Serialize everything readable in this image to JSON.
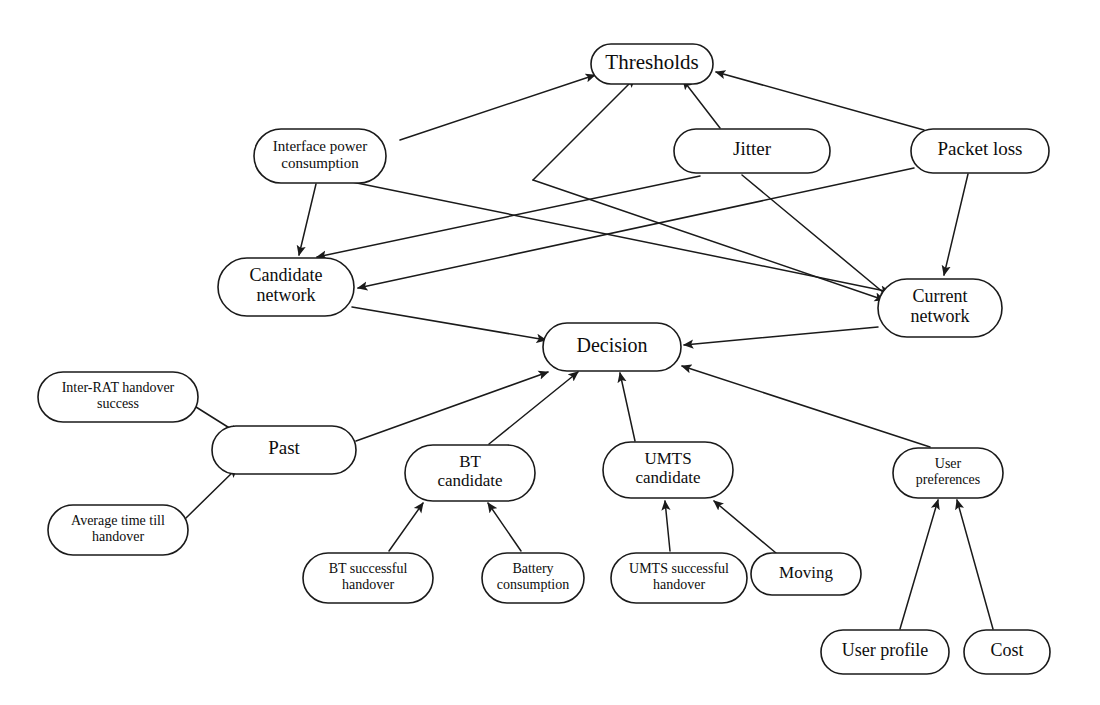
{
  "diagram": {
    "type": "directed-graph",
    "background_color": "#ffffff",
    "node_fill": "#ffffff",
    "node_stroke": "#1a1a1a",
    "edge_color": "#1a1a1a",
    "nodes": [
      {
        "id": "thresholds",
        "label": "Thresholds",
        "lines": [
          "Thresholds"
        ],
        "x": 652,
        "y": 64,
        "w": 122,
        "h": 40,
        "font_size": 21
      },
      {
        "id": "interface_power",
        "label": "Interface power consumption",
        "lines": [
          "Interface power",
          "consumption"
        ],
        "x": 320,
        "y": 156,
        "w": 132,
        "h": 54,
        "font_size": 15
      },
      {
        "id": "jitter",
        "label": "Jitter",
        "lines": [
          "Jitter"
        ],
        "x": 752,
        "y": 151,
        "w": 156,
        "h": 44,
        "font_size": 19
      },
      {
        "id": "packet_loss",
        "label": "Packet loss",
        "lines": [
          "Packet loss"
        ],
        "x": 980,
        "y": 151,
        "w": 138,
        "h": 44,
        "font_size": 19
      },
      {
        "id": "candidate_net",
        "label": "Candidate network",
        "lines": [
          "Candidate",
          "network"
        ],
        "x": 286,
        "y": 287,
        "w": 136,
        "h": 58,
        "font_size": 18
      },
      {
        "id": "current_net",
        "label": "Current network",
        "lines": [
          "Current",
          "network"
        ],
        "x": 940,
        "y": 308,
        "w": 124,
        "h": 58,
        "font_size": 18
      },
      {
        "id": "decision",
        "label": "Decision",
        "lines": [
          "Decision"
        ],
        "x": 612,
        "y": 347,
        "w": 138,
        "h": 48,
        "font_size": 20
      },
      {
        "id": "inter_rat",
        "label": "Inter-RAT handover success",
        "lines": [
          "Inter-RAT handover",
          "success"
        ],
        "x": 118,
        "y": 397,
        "w": 160,
        "h": 50,
        "font_size": 14
      },
      {
        "id": "past",
        "label": "Past",
        "lines": [
          "Past"
        ],
        "x": 284,
        "y": 450,
        "w": 144,
        "h": 48,
        "font_size": 19
      },
      {
        "id": "avg_time",
        "label": "Average time till handover",
        "lines": [
          "Average time till",
          "handover"
        ],
        "x": 118,
        "y": 530,
        "w": 140,
        "h": 50,
        "font_size": 14
      },
      {
        "id": "bt_candidate",
        "label": "BT candidate",
        "lines": [
          "BT",
          "candidate"
        ],
        "x": 470,
        "y": 473,
        "w": 130,
        "h": 56,
        "font_size": 17
      },
      {
        "id": "umts_candidate",
        "label": "UMTS candidate",
        "lines": [
          "UMTS",
          "candidate"
        ],
        "x": 668,
        "y": 470,
        "w": 130,
        "h": 56,
        "font_size": 17
      },
      {
        "id": "user_prefs",
        "label": "User preferences",
        "lines": [
          "User",
          "preferences"
        ],
        "x": 948,
        "y": 473,
        "w": 110,
        "h": 50,
        "font_size": 14
      },
      {
        "id": "bt_success",
        "label": "BT successful handover",
        "lines": [
          "BT successful",
          "handover"
        ],
        "x": 368,
        "y": 578,
        "w": 130,
        "h": 50,
        "font_size": 14
      },
      {
        "id": "battery",
        "label": "Battery consumption",
        "lines": [
          "Battery",
          "consumption"
        ],
        "x": 533,
        "y": 578,
        "w": 102,
        "h": 50,
        "font_size": 14
      },
      {
        "id": "umts_success",
        "label": "UMTS successful handover",
        "lines": [
          "UMTS successful",
          "handover"
        ],
        "x": 679,
        "y": 578,
        "w": 136,
        "h": 50,
        "font_size": 14
      },
      {
        "id": "moving",
        "label": "Moving",
        "lines": [
          "Moving"
        ],
        "x": 806,
        "y": 574,
        "w": 110,
        "h": 42,
        "font_size": 17
      },
      {
        "id": "user_profile",
        "label": "User profile",
        "lines": [
          "User profile"
        ],
        "x": 885,
        "y": 652,
        "w": 128,
        "h": 44,
        "font_size": 18
      },
      {
        "id": "cost",
        "label": "Cost",
        "lines": [
          "Cost"
        ],
        "x": 1007,
        "y": 652,
        "w": 86,
        "h": 44,
        "font_size": 18
      }
    ],
    "edges": [
      {
        "id": "e1",
        "from": "interface_power",
        "to": "thresholds",
        "points": "400,140 595,75",
        "arrow": true
      },
      {
        "id": "e2",
        "from": "candidate_net",
        "to": "thresholds",
        "points": "533,180 635,78",
        "arrow": true
      },
      {
        "id": "e3",
        "from": "jitter",
        "to": "thresholds",
        "points": "720,128 683,80",
        "arrow": true
      },
      {
        "id": "e4",
        "from": "packet_loss",
        "to": "thresholds",
        "points": "924,130 716,72",
        "arrow": true
      },
      {
        "id": "e5",
        "from": "interface_power",
        "to": "candidate_net",
        "points": "316,184 299,255",
        "arrow": true
      },
      {
        "id": "e6",
        "from": "jitter",
        "to": "candidate_net",
        "points": "700,176 317,257",
        "arrow": true
      },
      {
        "id": "e7",
        "from": "packet_loss",
        "to": "candidate_net",
        "points": "914,168 358,288",
        "arrow": true
      },
      {
        "id": "e8",
        "from": "packet_loss",
        "to": "current_net",
        "points": "968,174 944,275",
        "arrow": true
      },
      {
        "id": "e9",
        "from": "interface_power",
        "to": "current_net",
        "points": "352,182 890,292",
        "arrow": true
      },
      {
        "id": "e10",
        "from": "thresholds",
        "to": "current_net",
        "points": "533,180 884,300",
        "arrow": true
      },
      {
        "id": "e11",
        "from": "jitter",
        "to": "current_net",
        "points": "742,175 890,298",
        "arrow": true
      },
      {
        "id": "e12",
        "from": "candidate_net",
        "to": "decision",
        "points": "352,307 546,340",
        "arrow": true
      },
      {
        "id": "e13",
        "from": "current_net",
        "to": "decision",
        "points": "878,327 684,345",
        "arrow": true
      },
      {
        "id": "e14",
        "from": "past",
        "to": "decision",
        "points": "356,441 548,372",
        "arrow": true
      },
      {
        "id": "e15",
        "from": "bt_candidate",
        "to": "decision",
        "points": "489,444 578,372",
        "arrow": true
      },
      {
        "id": "e16",
        "from": "umts_candidate",
        "to": "decision",
        "points": "635,441 620,373",
        "arrow": true
      },
      {
        "id": "e17",
        "from": "user_prefs",
        "to": "decision",
        "points": "930,447 682,366",
        "arrow": true
      },
      {
        "id": "e18",
        "from": "inter_rat",
        "to": "past",
        "points": "196,407 239,434",
        "arrow": true
      },
      {
        "id": "e19",
        "from": "avg_time",
        "to": "past",
        "points": "186,518 237,468",
        "arrow": true
      },
      {
        "id": "e20",
        "from": "bt_success",
        "to": "bt_candidate",
        "points": "389,551 423,503",
        "arrow": true
      },
      {
        "id": "e21",
        "from": "battery",
        "to": "bt_candidate",
        "points": "521,551 488,503",
        "arrow": true
      },
      {
        "id": "e22",
        "from": "umts_success",
        "to": "umts_candidate",
        "points": "670,551 665,501",
        "arrow": true
      },
      {
        "id": "e23",
        "from": "moving",
        "to": "umts_candidate",
        "points": "776,553 714,501",
        "arrow": true
      },
      {
        "id": "e24",
        "from": "user_profile",
        "to": "user_prefs",
        "points": "900,629 938,500",
        "arrow": true
      },
      {
        "id": "e25",
        "from": "cost",
        "to": "user_prefs",
        "points": "993,629 957,500",
        "arrow": true
      }
    ]
  }
}
